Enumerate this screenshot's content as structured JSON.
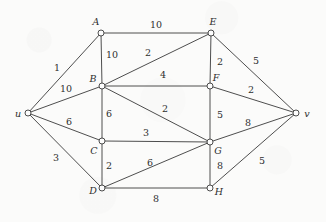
{
  "diagram": {
    "type": "node-link-graph",
    "width": 326,
    "height": 222,
    "background_color": "#fbfbfa",
    "stroke_color": "#3a3a3a",
    "text_color": "#2e2e2e",
    "nodes": [
      {
        "id": "u",
        "label": "u",
        "x": 28,
        "y": 113,
        "label_x": 18,
        "label_y": 113
      },
      {
        "id": "A",
        "label": "A",
        "x": 101,
        "y": 33,
        "label_x": 96,
        "label_y": 21
      },
      {
        "id": "B",
        "label": "B",
        "x": 102,
        "y": 86,
        "label_x": 93,
        "label_y": 78
      },
      {
        "id": "C",
        "label": "C",
        "x": 102,
        "y": 141,
        "label_x": 94,
        "label_y": 150
      },
      {
        "id": "D",
        "label": "D",
        "x": 102,
        "y": 188,
        "label_x": 93,
        "label_y": 190
      },
      {
        "id": "E",
        "label": "E",
        "x": 211,
        "y": 33,
        "label_x": 213,
        "label_y": 21
      },
      {
        "id": "F",
        "label": "F",
        "x": 210,
        "y": 86,
        "label_x": 216,
        "label_y": 77
      },
      {
        "id": "G",
        "label": "G",
        "x": 210,
        "y": 142,
        "label_x": 218,
        "label_y": 150
      },
      {
        "id": "H",
        "label": "H",
        "x": 210,
        "y": 188,
        "label_x": 219,
        "label_y": 191
      },
      {
        "id": "v",
        "label": "v",
        "x": 296,
        "y": 113,
        "label_x": 307,
        "label_y": 113
      }
    ],
    "node_radius": 3,
    "edges": [
      {
        "from": "u",
        "to": "A",
        "weight": "1",
        "label_x": 57,
        "label_y": 67
      },
      {
        "from": "u",
        "to": "B",
        "weight": "10",
        "label_x": 66,
        "label_y": 88
      },
      {
        "from": "u",
        "to": "C",
        "weight": "6",
        "label_x": 69,
        "label_y": 121
      },
      {
        "from": "u",
        "to": "D",
        "weight": "3",
        "label_x": 56,
        "label_y": 157
      },
      {
        "from": "A",
        "to": "E",
        "weight": "10",
        "label_x": 156,
        "label_y": 24
      },
      {
        "from": "A",
        "to": "B",
        "weight": "10",
        "label_x": 112,
        "label_y": 54
      },
      {
        "from": "B",
        "to": "E",
        "weight": "2",
        "label_x": 148,
        "label_y": 52
      },
      {
        "from": "B",
        "to": "F",
        "weight": "4",
        "label_x": 163,
        "label_y": 74
      },
      {
        "from": "B",
        "to": "C",
        "weight": "6",
        "label_x": 109,
        "label_y": 113
      },
      {
        "from": "B",
        "to": "G",
        "weight": "2",
        "label_x": 165,
        "label_y": 108
      },
      {
        "from": "C",
        "to": "G",
        "weight": "3",
        "label_x": 146,
        "label_y": 132
      },
      {
        "from": "C",
        "to": "D",
        "weight": "2",
        "label_x": 109,
        "label_y": 165
      },
      {
        "from": "D",
        "to": "G",
        "weight": "6",
        "label_x": 150,
        "label_y": 162
      },
      {
        "from": "D",
        "to": "H",
        "weight": "8",
        "label_x": 156,
        "label_y": 198
      },
      {
        "from": "E",
        "to": "F",
        "weight": "2",
        "label_x": 220,
        "label_y": 61
      },
      {
        "from": "E",
        "to": "v",
        "weight": "5",
        "label_x": 256,
        "label_y": 60
      },
      {
        "from": "F",
        "to": "v",
        "weight": "2",
        "label_x": 251,
        "label_y": 89
      },
      {
        "from": "F",
        "to": "G",
        "weight": "5",
        "label_x": 220,
        "label_y": 114
      },
      {
        "from": "G",
        "to": "v",
        "weight": "8",
        "label_x": 248,
        "label_y": 122
      },
      {
        "from": "G",
        "to": "H",
        "weight": "8",
        "label_x": 220,
        "label_y": 165
      },
      {
        "from": "H",
        "to": "v",
        "weight": "5",
        "label_x": 262,
        "label_y": 160
      }
    ]
  }
}
